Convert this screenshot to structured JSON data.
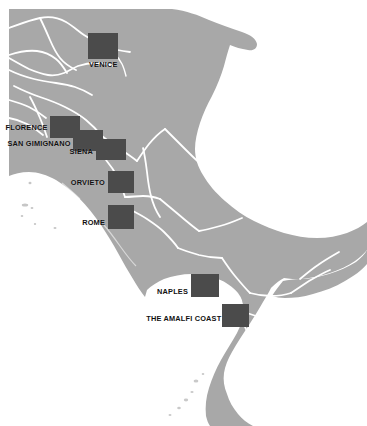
{
  "map": {
    "title": "Italy Tour Destinations Map",
    "region": "Italy",
    "colors": {
      "land": "#a8a8a8",
      "land_shadow": "#9d9d9d",
      "sea": "#ffffff",
      "border_line": "#ffffff",
      "marker_fill": "#4b4b4b",
      "label_text": "#111111"
    },
    "markers": [
      {
        "id": "venice",
        "label": "VENICE",
        "box": {
          "x": 88,
          "y": 33,
          "w": 30,
          "h": 26
        },
        "label_pos": {
          "x": 89,
          "y": 60,
          "align": "left"
        }
      },
      {
        "id": "florence",
        "label": "FLORENCE",
        "box": {
          "x": 50,
          "y": 116,
          "w": 30,
          "h": 22
        },
        "label_pos": {
          "x": 47,
          "y": 123,
          "align": "right"
        }
      },
      {
        "id": "san-gimignano",
        "label": "SAN GIMIGNANO",
        "box": {
          "x": 73,
          "y": 130,
          "w": 30,
          "h": 21
        },
        "label_pos": {
          "x": 70,
          "y": 139,
          "align": "right"
        }
      },
      {
        "id": "siena",
        "label": "SIENA",
        "box": {
          "x": 96,
          "y": 139,
          "w": 30,
          "h": 21
        },
        "label_pos": {
          "x": 93,
          "y": 147,
          "align": "right"
        }
      },
      {
        "id": "orvieto",
        "label": "ORVIETO",
        "box": {
          "x": 108,
          "y": 171,
          "w": 26,
          "h": 22
        },
        "label_pos": {
          "x": 105,
          "y": 178,
          "align": "right"
        }
      },
      {
        "id": "rome",
        "label": "ROME",
        "box": {
          "x": 108,
          "y": 205,
          "w": 26,
          "h": 24
        },
        "label_pos": {
          "x": 105,
          "y": 218,
          "align": "right"
        }
      },
      {
        "id": "naples",
        "label": "NAPLES",
        "box": {
          "x": 191,
          "y": 274,
          "w": 28,
          "h": 23
        },
        "label_pos": {
          "x": 188,
          "y": 287,
          "align": "right"
        }
      },
      {
        "id": "amalfi-coast",
        "label": "THE AMALFI COAST",
        "box": {
          "x": 222,
          "y": 304,
          "w": 27,
          "h": 23
        },
        "label_pos": {
          "x": 219,
          "y": 314,
          "align": "right"
        }
      }
    ]
  }
}
